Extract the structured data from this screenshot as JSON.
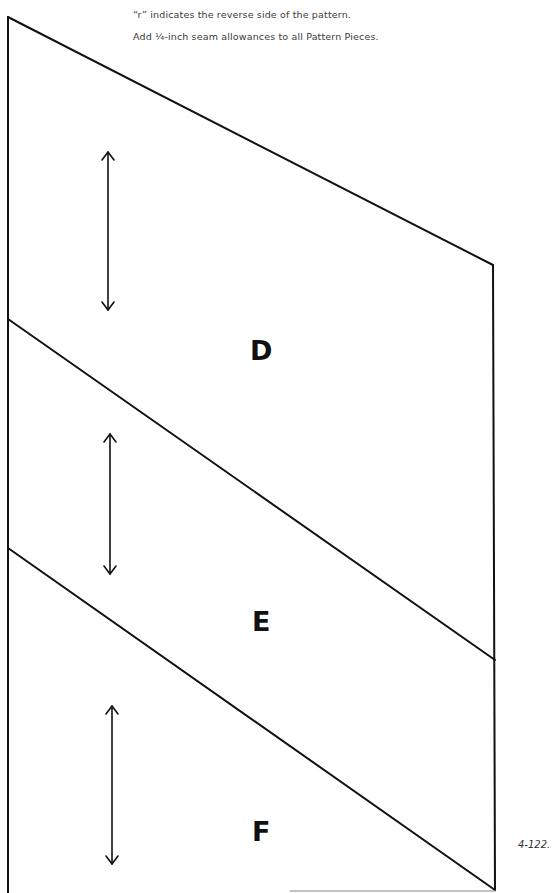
{
  "notes": {
    "line1": "“r” indicates the reverse side of the pattern.",
    "line2": "Add ¼-inch seam allowances to all Pattern Pieces."
  },
  "pattern": {
    "pieces": [
      {
        "label": "D",
        "grainline": "grainline-arrow"
      },
      {
        "label": "E",
        "grainline": "grainline-arrow"
      },
      {
        "label": "F",
        "grainline": "grainline-arrow"
      }
    ],
    "line_color": "#111111"
  },
  "figure": {
    "label": "4-122."
  }
}
